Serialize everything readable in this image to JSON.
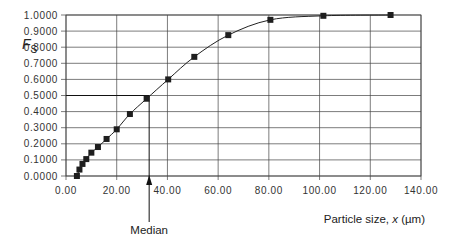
{
  "chart_data": {
    "type": "line",
    "title": "",
    "xlabel": "Particle size, x (µm)",
    "xlabel_parts": {
      "prefix": "Particle size, ",
      "var": "x",
      "suffix": " (µm)"
    },
    "ylabel": "FS",
    "ylabel_parts": {
      "main": "F",
      "sub": "S"
    },
    "xlim": [
      0,
      140
    ],
    "ylim": [
      0,
      1
    ],
    "x_ticks": [
      0,
      20,
      40,
      60,
      80,
      100,
      120,
      140
    ],
    "x_tick_labels": [
      "0.00",
      "20.00",
      "40.00",
      "60.00",
      "80.00",
      "100.00",
      "120.00",
      "140.00"
    ],
    "y_ticks": [
      0,
      0.1,
      0.2,
      0.3,
      0.4,
      0.5,
      0.6,
      0.7,
      0.8,
      0.9,
      1.0
    ],
    "y_tick_labels": [
      "0.0000",
      "0.1000",
      "0.2000",
      "0.3000",
      "0.4000",
      "0.5000",
      "0.6000",
      "0.7000",
      "0.8000",
      "0.9000",
      "1.0000"
    ],
    "grid": true,
    "legend": null,
    "series": [
      {
        "name": "Cumulative fraction undersize",
        "marker": "square",
        "x": [
          4.3,
          5.3,
          6.5,
          8.0,
          10.0,
          12.6,
          16.0,
          20.0,
          25.2,
          31.8,
          40.3,
          50.6,
          64.0,
          80.6,
          101.5,
          128.0
        ],
        "y": [
          0.0,
          0.04,
          0.075,
          0.105,
          0.145,
          0.18,
          0.23,
          0.29,
          0.385,
          0.48,
          0.6,
          0.74,
          0.875,
          0.97,
          0.995,
          1.0
        ]
      }
    ],
    "annotations": [
      {
        "text": "Median",
        "type": "arrow",
        "x": 32.8,
        "y_from": 0.5,
        "note": "horizontal line at F=0.5 meets curve, vertical drop to x-axis"
      }
    ]
  },
  "labels": {
    "median": "Median"
  }
}
